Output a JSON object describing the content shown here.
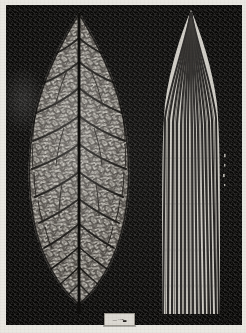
{
  "plate": {
    "title": "Leaf skeletons: netted venation compared with parallel venation",
    "medium": "halftone photographic plate",
    "background_color": "#0c0b09",
    "paper_color": "#e9e7e1",
    "vein_color": "#171513",
    "lamina_color": "#b9b6ae",
    "border_width_px": 5
  },
  "specimens": [
    {
      "id": "dicot",
      "position": "left",
      "common_name": "Dicot leaf skeleton",
      "venation": "reticulate",
      "outline": "elliptic-ovate, entire margin, acuminate apex",
      "features": {
        "midrib": "single prominent central midrib running apex to petiole",
        "secondary_veins": 11,
        "tertiary_network": "dense polygonal areoles",
        "petiole": "short, dark, at base"
      },
      "label": "A"
    },
    {
      "id": "monocot",
      "position": "right",
      "common_name": "Monocot leaf skeleton",
      "venation": "parallel",
      "outline": "linear-lanceolate, acute apex, base extending past plate edge",
      "features": {
        "midrib": "not differentiated; veins of near-equal calibre",
        "parallel_veins": 17,
        "cross_veins": "fine, inconspicuous",
        "petiole": "none visible"
      },
      "label": "B"
    }
  ],
  "label_card": {
    "line1": "— · ─▪▃",
    "legible": false,
    "note": "small white specimen card, text illegible at this resolution"
  },
  "colors": {
    "ground": "#0c0b09",
    "paper": "#e9e7e1",
    "vein": "#171513",
    "lamina_light": "#cfccc4",
    "lamina_mid": "#a8a49b",
    "label_card": "#dcd9d2"
  }
}
